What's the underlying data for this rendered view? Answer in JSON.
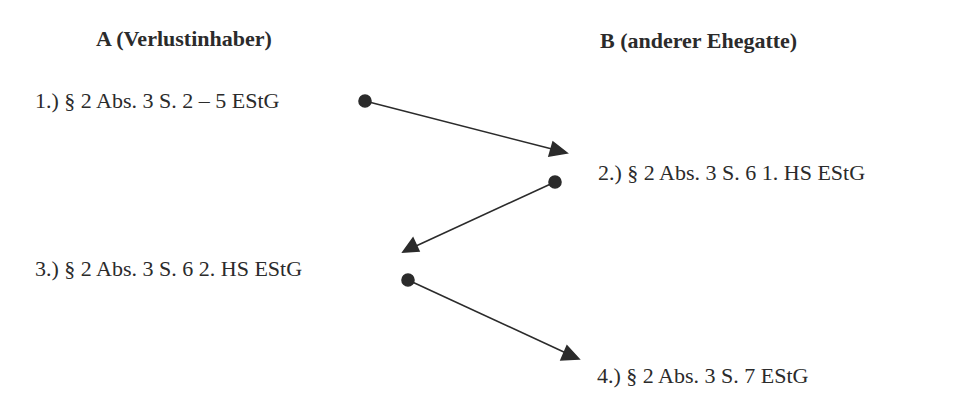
{
  "columns": {
    "a": {
      "label": "A (Verlustinhaber)"
    },
    "b": {
      "label": "B (anderer Ehegatte)"
    }
  },
  "steps": [
    {
      "label": "1.) § 2 Abs. 3 S. 2 – 5 EStG",
      "column": "A"
    },
    {
      "label": "2.) § 2 Abs. 3 S. 6 1. HS EStG",
      "column": "B"
    },
    {
      "label": "3.) § 2 Abs. 3 S. 6 2. HS EStG",
      "column": "A"
    },
    {
      "label": "4.) § 2 Abs. 3 S. 7 EStG",
      "column": "B"
    }
  ],
  "edges": [
    {
      "from": "1",
      "to": "2"
    },
    {
      "from": "2",
      "to": "3"
    },
    {
      "from": "3",
      "to": "4"
    }
  ],
  "colors": {
    "ink": "#2b2b2b",
    "background": "#ffffff"
  }
}
